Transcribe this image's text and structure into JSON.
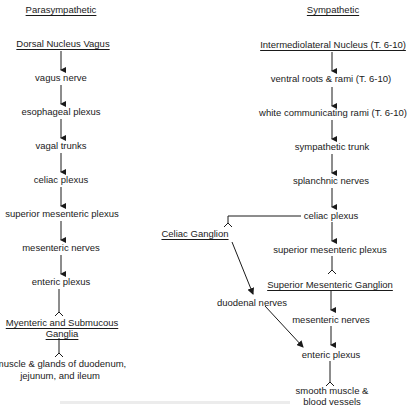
{
  "parasympathetic": {
    "title": "Parasympathetic",
    "nodes": [
      "Dorsal Nucleus Vagus",
      "vagus nerve",
      "esophageal plexus",
      "vagal trunks",
      "celiac plexus",
      "superior mesenteric plexus",
      "mesenteric nerves",
      "enteric plexus",
      "Myenteric and Submucous",
      "Ganglia",
      "muscle & glands of duodenum,",
      "jejunum, and ileum"
    ]
  },
  "sympathetic": {
    "title": "Sympathetic",
    "nodes": [
      "Intermediolateral Nucleus (T. 6-10)",
      "ventral roots & rami (T. 6-10)",
      "white communicating rami (T. 6-10)",
      "sympathetic trunk",
      "splanchnic nerves",
      "celiac plexus",
      "Celiac Ganglion",
      "superior mesenteric plexus",
      "Superior Mesenteric Ganglion",
      "duodenal nerves",
      "mesenteric nerves",
      "enteric plexus",
      "smooth muscle &",
      "blood vessels"
    ]
  },
  "colors": {
    "ink": "#1a1a1a",
    "background": "#ffffff"
  }
}
